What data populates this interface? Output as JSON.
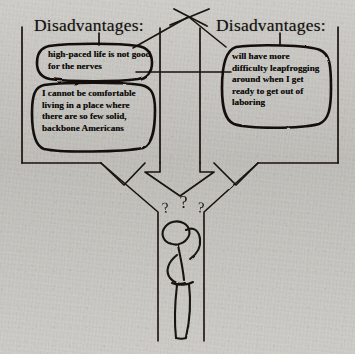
{
  "page": {
    "kind": "scanned-handdrawn-diagram",
    "background_color": "#cbc9c4",
    "ink_color": "#100e0b"
  },
  "headings": {
    "left": "Disadvantages:",
    "right": "Disadvantages:"
  },
  "bubbles": [
    {
      "id": "bubble-left-top",
      "side": "left",
      "text": "high-paced life is not good for the nerves"
    },
    {
      "id": "bubble-left-bottom",
      "side": "left",
      "text": "I cannot be comfortable living in a place where there are so few solid, backbone Americans"
    },
    {
      "id": "bubble-right",
      "side": "right",
      "text": "will have more difficulty leapfrogging around when I get ready to get out of laboring"
    }
  ],
  "figure": {
    "name": "confused-stick-figure",
    "question_marks": [
      "?",
      "?",
      "?"
    ]
  }
}
